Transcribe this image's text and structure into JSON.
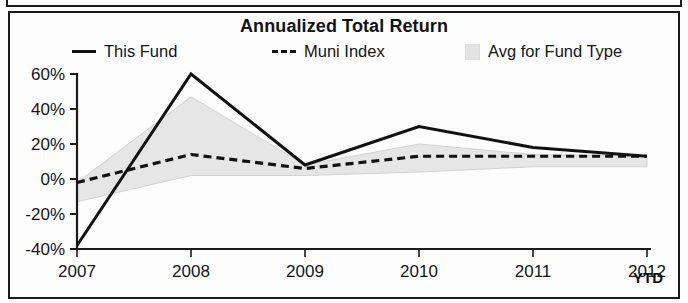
{
  "chart_data": {
    "type": "line",
    "title": "Annualized Total Return",
    "xlabel": "",
    "ylabel": "",
    "x": [
      "2007",
      "2008",
      "2009",
      "2010",
      "2011",
      "2012"
    ],
    "categories": [
      "2007",
      "2008",
      "2009",
      "2010",
      "2011",
      "2012"
    ],
    "ylim": [
      -40,
      60
    ],
    "yticks": [
      60,
      40,
      20,
      0,
      -20,
      -40
    ],
    "ytick_labels": [
      "60%",
      "40%",
      "20%",
      "0%",
      "-20%",
      "-40%"
    ],
    "xtick_labels": [
      "2007",
      "2008",
      "2009",
      "2010",
      "2011",
      "2012"
    ],
    "x_axis_suffix": "YTD",
    "grid": false,
    "legend_position": "top",
    "series": [
      {
        "name": "This Fund",
        "style": "solid",
        "color": "#111111",
        "values": [
          -38,
          60,
          8,
          30,
          18,
          13
        ]
      },
      {
        "name": "Muni Index",
        "style": "dashed",
        "color": "#111111",
        "values": [
          -2,
          14,
          6,
          13,
          13,
          13
        ]
      },
      {
        "name": "Avg for Fund Type",
        "style": "band",
        "color": "#e6e6e6",
        "upper": [
          -2,
          47,
          8,
          20,
          14,
          13
        ],
        "lower": [
          -13,
          2,
          2,
          4,
          7,
          7
        ]
      }
    ]
  },
  "chart": {
    "title": "Annualized Total Return",
    "ytd_label": "YTD",
    "legend": [
      {
        "label": "This Fund",
        "swatch": "solid-line-swatch"
      },
      {
        "label": "Muni Index",
        "swatch": "dashed-line-swatch"
      },
      {
        "label": "Avg for Fund Type",
        "swatch": "filled-square-swatch"
      }
    ],
    "y_axis": {
      "labels": [
        "60%",
        "40%",
        "20%",
        "0%",
        "-20%",
        "-40%"
      ]
    },
    "x_axis": {
      "labels": [
        "2007",
        "2008",
        "2009",
        "2010",
        "2011",
        "2012"
      ]
    },
    "colors": {
      "line": "#111111",
      "band_fill": "#e6e6e6",
      "axis": "#1a1a1a",
      "frame": "#1a1a1a"
    }
  }
}
